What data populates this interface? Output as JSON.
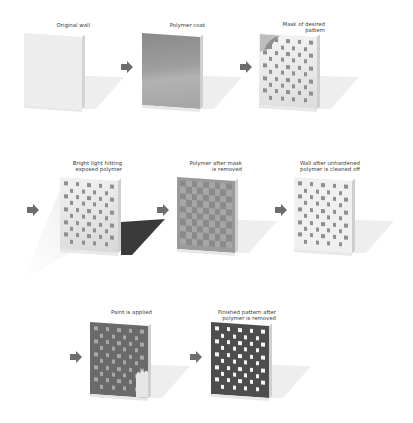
{
  "steps": [
    {
      "id": "original-wall",
      "label": "Original wall"
    },
    {
      "id": "polymer-coat",
      "label": "Polymer coat"
    },
    {
      "id": "mask",
      "label": "Mask of desired\npattern"
    },
    {
      "id": "bright-light",
      "label": "Bright light hitting\nexposed polymer"
    },
    {
      "id": "mask-removed",
      "label": "Polymer after mask\nis removed"
    },
    {
      "id": "cleaned",
      "label": "Wall after unhardened\npolymer is cleaned off"
    },
    {
      "id": "paint",
      "label": "Paint is applied"
    },
    {
      "id": "finished",
      "label": "Finished pattern after\npolymer is removed"
    }
  ],
  "colors": {
    "wall": "#ececec",
    "polymer": "#9a9a9a",
    "checker_dark": "#8f8f8f",
    "checker_light": "#efefef",
    "paint": "#6a6a6a",
    "finished_dark": "#4d4d4d",
    "finished_light": "#f4f4f4",
    "arrow": "#6d6d6d",
    "shadow": "#ececec",
    "light_shadow": "#3a3a3a"
  },
  "arrows": [
    {
      "from": "original-wall",
      "to": "polymer-coat"
    },
    {
      "from": "polymer-coat",
      "to": "mask"
    },
    {
      "from": "mask",
      "to": "bright-light"
    },
    {
      "from": "bright-light",
      "to": "mask-removed"
    },
    {
      "from": "mask-removed",
      "to": "cleaned"
    },
    {
      "from": "cleaned",
      "to": "paint"
    },
    {
      "from": "paint",
      "to": "finished"
    }
  ]
}
